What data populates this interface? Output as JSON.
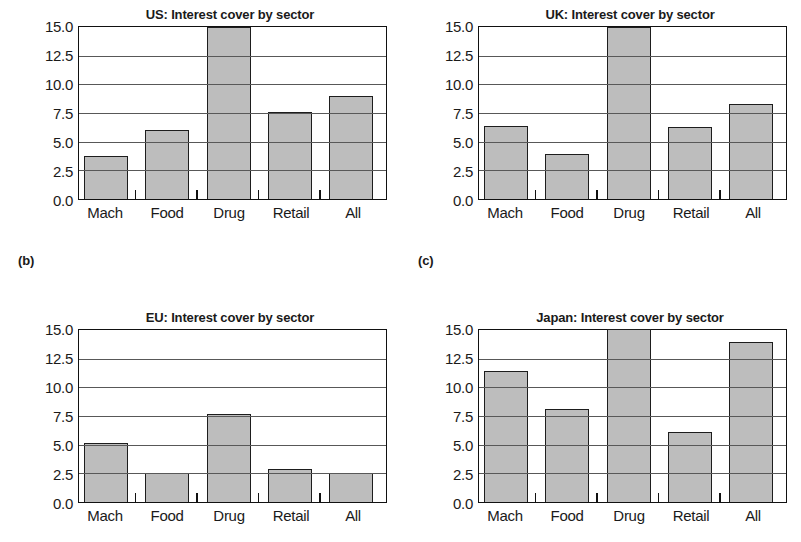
{
  "figure": {
    "panel_labels": [
      "(b)",
      "(c)"
    ],
    "bar_color": "#bdbdbd",
    "bar_edge_color": "#1d1d1d",
    "gridline_color": "#585858",
    "axis_color": "#111111"
  },
  "chart_data": [
    {
      "type": "bar",
      "title": "US: Interest cover by sector",
      "xlabel": "",
      "ylabel": "",
      "categories": [
        "Mach",
        "Food",
        "Drug",
        "Retail",
        "All"
      ],
      "values": [
        3.7,
        5.9,
        14.9,
        7.5,
        8.9
      ],
      "ylim": [
        0.0,
        15.0
      ],
      "yticks": [
        0.0,
        2.5,
        5.0,
        7.5,
        10.0,
        12.5,
        15.0
      ],
      "ytick_labels": [
        "0.0",
        "2.5",
        "5.0",
        "7.5",
        "10.0",
        "12.5",
        "15.0"
      ],
      "grid": true,
      "legend": null
    },
    {
      "type": "bar",
      "title": "UK: Interest cover by sector",
      "xlabel": "",
      "ylabel": "",
      "categories": [
        "Mach",
        "Food",
        "Drug",
        "Retail",
        "All"
      ],
      "values": [
        6.3,
        3.85,
        14.9,
        6.2,
        8.2
      ],
      "ylim": [
        0.0,
        15.0
      ],
      "yticks": [
        0.0,
        2.5,
        5.0,
        7.5,
        10.0,
        12.5,
        15.0
      ],
      "ytick_labels": [
        "0.0",
        "2.5",
        "5.0",
        "7.5",
        "10.0",
        "12.5",
        "15.0"
      ],
      "grid": true,
      "legend": null
    },
    {
      "type": "bar",
      "title": "EU: Interest cover by sector",
      "xlabel": "",
      "ylabel": "",
      "categories": [
        "Mach",
        "Food",
        "Drug",
        "Retail",
        "All"
      ],
      "values": [
        5.1,
        2.4,
        7.55,
        2.75,
        2.45
      ],
      "ylim": [
        0.0,
        15.0
      ],
      "yticks": [
        0.0,
        2.5,
        5.0,
        7.5,
        10.0,
        12.5,
        15.0
      ],
      "ytick_labels": [
        "0.0",
        "2.5",
        "5.0",
        "7.5",
        "10.0",
        "12.5",
        "15.0"
      ],
      "grid": true,
      "legend": null
    },
    {
      "type": "bar",
      "title": "Japan: Interest cover by sector",
      "xlabel": "",
      "ylabel": "",
      "categories": [
        "Mach",
        "Food",
        "Drug",
        "Retail",
        "All"
      ],
      "values": [
        11.3,
        8.0,
        15.0,
        6.0,
        13.9
      ],
      "ylim": [
        0.0,
        15.0
      ],
      "yticks": [
        0.0,
        2.5,
        5.0,
        7.5,
        10.0,
        12.5,
        15.0
      ],
      "ytick_labels": [
        "0.0",
        "2.5",
        "5.0",
        "7.5",
        "10.0",
        "12.5",
        "15.0"
      ],
      "grid": true,
      "legend": null
    }
  ]
}
